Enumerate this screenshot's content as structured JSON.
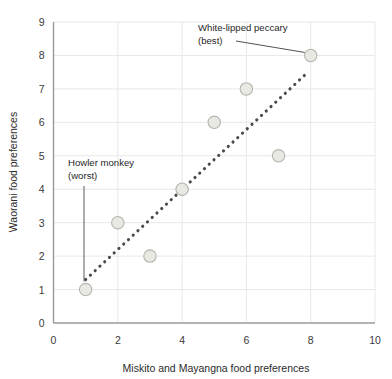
{
  "chart_data": {
    "type": "scatter",
    "title": "",
    "xlabel": "Miskito and Mayangna food preferences",
    "ylabel": "Waorani food preferences",
    "xlim": [
      0,
      10
    ],
    "ylim": [
      0,
      9
    ],
    "xticks": [
      0,
      2,
      4,
      6,
      8,
      10
    ],
    "xtick_labels": [
      "0",
      "2",
      "4",
      "6",
      "8",
      "10"
    ],
    "yticks": [
      0,
      1,
      2,
      3,
      4,
      5,
      6,
      7,
      8,
      9
    ],
    "ytick_labels": [
      "0",
      "1",
      "2",
      "3",
      "4",
      "5",
      "6",
      "7",
      "8",
      "9"
    ],
    "grid": true,
    "grid_color": "#e8e8e8",
    "axis_color": "#8a8a8a",
    "legend": null,
    "points": [
      {
        "x": 1,
        "y": 1,
        "label": "Howler monkey (worst)"
      },
      {
        "x": 2,
        "y": 3,
        "label": ""
      },
      {
        "x": 3,
        "y": 2,
        "label": ""
      },
      {
        "x": 4,
        "y": 4,
        "label": ""
      },
      {
        "x": 5,
        "y": 6,
        "label": ""
      },
      {
        "x": 6,
        "y": 7,
        "label": ""
      },
      {
        "x": 7,
        "y": 5,
        "label": ""
      },
      {
        "x": 8,
        "y": 8,
        "label": "White-lipped peccary (best)"
      }
    ],
    "marker": {
      "shape": "circle",
      "fill": "#e9e9e4",
      "stroke": "#b5b5ae",
      "radius": 6.2
    },
    "trendline": {
      "style": "dotted",
      "color": "#4a4a4a",
      "x_start": 1.0,
      "y_start": 1.3,
      "x_end": 7.8,
      "y_end": 7.4
    },
    "annotations": [
      {
        "name": "white-lipped-peccary",
        "line1": "White-lipped peccary",
        "line2": "(best)",
        "target_point": {
          "x": 8,
          "y": 8
        },
        "leader": "diagonal"
      },
      {
        "name": "howler-monkey",
        "line1": "Howler monkey",
        "line2": "(worst)",
        "target_point": {
          "x": 1,
          "y": 1
        },
        "leader": "vertical"
      }
    ]
  }
}
